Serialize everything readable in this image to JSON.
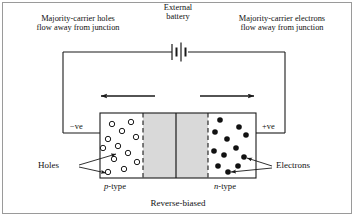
{
  "figure": {
    "caption": "Reverse-biased",
    "top_labels": {
      "left_line1": "Majority-carrier holes",
      "left_line2": "flow away from junction",
      "center_line1": "External",
      "center_line2": "battery",
      "right_line1": "Majority-carrier electrons",
      "right_line2": "flow away from junction"
    },
    "terminals": {
      "negative": "−ve",
      "positive": "+ve"
    },
    "regions": {
      "p_type_prefix": "p",
      "p_type_suffix": "-type",
      "n_type_prefix": "n",
      "n_type_suffix": "-type"
    },
    "callouts": {
      "holes": "Holes",
      "electrons": "Electrons"
    },
    "colors": {
      "stroke": "#1a1a1a",
      "frame": "#9a9a9a",
      "depletion_fill": "#d9d9d9",
      "hole_fill": "#ffffff",
      "electron_fill": "#111111",
      "background": "#ffffff"
    },
    "geometry": {
      "block_left": 100,
      "block_right": 256,
      "block_top": 113,
      "block_bottom": 178,
      "depletion_left": 143,
      "depletion_right": 208,
      "junction_x": 176,
      "wire_top_y": 52,
      "wire_left_x": 63,
      "wire_right_x": 285,
      "battery_x": 180
    },
    "holes": [
      {
        "cx": 112,
        "cy": 124
      },
      {
        "cx": 131,
        "cy": 122
      },
      {
        "cx": 122,
        "cy": 131
      },
      {
        "cx": 108,
        "cy": 139
      },
      {
        "cx": 136,
        "cy": 137
      },
      {
        "cx": 118,
        "cy": 146
      },
      {
        "cx": 103,
        "cy": 148
      },
      {
        "cx": 128,
        "cy": 153
      },
      {
        "cx": 114,
        "cy": 159
      },
      {
        "cx": 137,
        "cy": 162
      },
      {
        "cx": 124,
        "cy": 169
      },
      {
        "cx": 108,
        "cy": 172
      }
    ],
    "electrons": [
      {
        "cx": 220,
        "cy": 120
      },
      {
        "cx": 239,
        "cy": 127
      },
      {
        "cx": 215,
        "cy": 132
      },
      {
        "cx": 246,
        "cy": 135
      },
      {
        "cx": 227,
        "cy": 139
      },
      {
        "cx": 236,
        "cy": 148
      },
      {
        "cx": 214,
        "cy": 151
      },
      {
        "cx": 224,
        "cy": 155
      },
      {
        "cx": 244,
        "cy": 157
      },
      {
        "cx": 218,
        "cy": 166
      },
      {
        "cx": 238,
        "cy": 166
      },
      {
        "cx": 228,
        "cy": 172
      }
    ],
    "arrows": {
      "left_label": "hole-drift-arrow-left",
      "right_label": "electron-drift-arrow-right"
    }
  }
}
